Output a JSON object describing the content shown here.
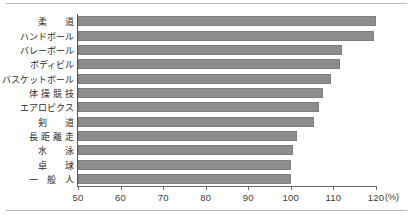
{
  "chart_data": {
    "type": "bar",
    "orientation": "horizontal",
    "title": "",
    "xlabel": "(%)",
    "ylabel": "",
    "xlim": [
      50,
      120
    ],
    "xticks": [
      50,
      60,
      70,
      80,
      90,
      100,
      110,
      120
    ],
    "xtick_labels": [
      "50",
      "60",
      "70",
      "80",
      "90",
      "100",
      "110",
      "120"
    ],
    "unit": "(%)",
    "grid": false,
    "legend": null,
    "bar_color": "#8d8d8d",
    "categories": [
      "柔　　道",
      "ハンドボール",
      "バレーボール",
      "ボディビル",
      "バスケットボール",
      "体 操 競 技",
      "エアロビクス",
      "剣　　道",
      "長 距 離 走",
      "水　　泳",
      "卓　　球",
      "一　般　人"
    ],
    "values": [
      120,
      119.5,
      112,
      111.5,
      109.5,
      107.5,
      106.5,
      105.5,
      101.5,
      100.5,
      100,
      100
    ]
  }
}
